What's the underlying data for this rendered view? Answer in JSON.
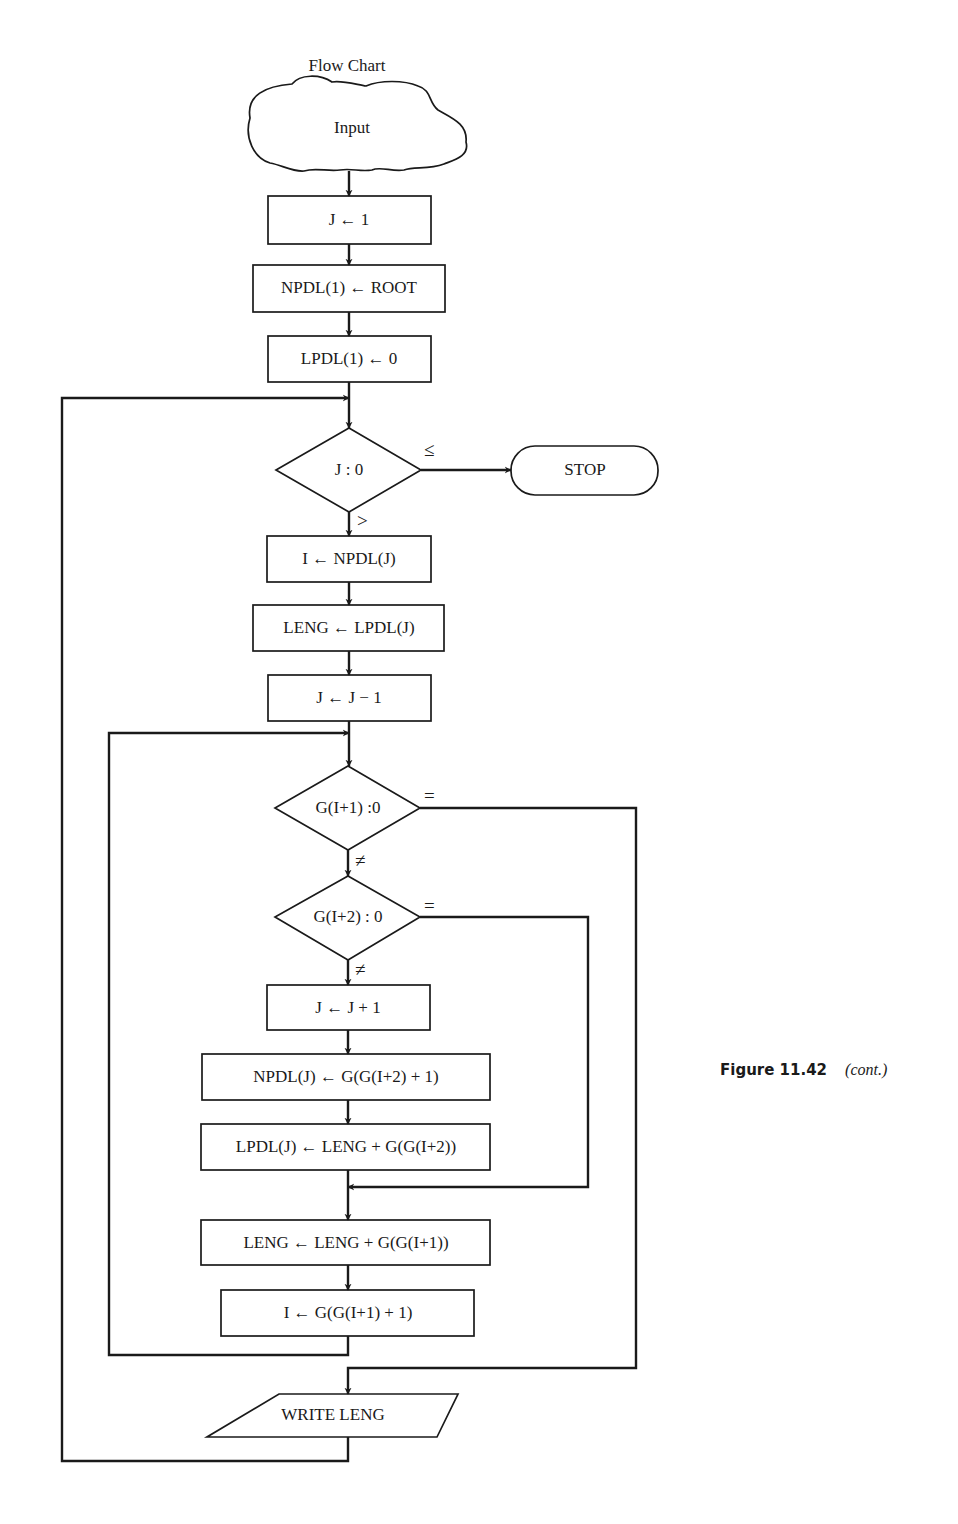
{
  "diagram": {
    "title": "Flow Chart",
    "caption": {
      "figure": "Figure 11.42",
      "note": "(cont.)"
    },
    "nodes": {
      "input": "Input",
      "j_init": "J ← 1",
      "npdl_init": "NPDL(1) ← ROOT",
      "lpdl_init": "LPDL(1) ← 0",
      "decision_j": "J : 0",
      "stop": "STOP",
      "i_assign": "I ← NPDL(J)",
      "leng_assign": "LENG ← LPDL(J)",
      "j_dec": "J ← J − 1",
      "decision_g1": "G(I+1) :0",
      "decision_g2": "G(I+2) : 0",
      "j_inc": "J ← J + 1",
      "npdl_push": "NPDL(J) ← G(G(I+2) + 1)",
      "lpdl_push": "LPDL(J) ← LENG + G(G(I+2))",
      "leng_update": "LENG ← LENG + G(G(I+1))",
      "i_update": "I ← G(G(I+1) + 1)",
      "write": "WRITE LENG"
    },
    "conditions": {
      "j_le": "≤",
      "j_gt": ">",
      "g1_eq": "=",
      "g1_ne": "≠",
      "g2_eq": "=",
      "g2_ne": "≠"
    }
  }
}
